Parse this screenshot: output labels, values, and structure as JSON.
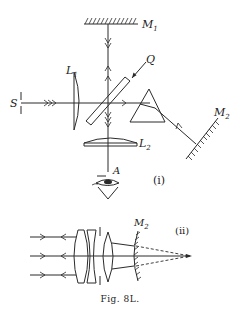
{
  "figure": {
    "caption": "Fig. 8L.",
    "part_i": {
      "label": "(i)",
      "components": {
        "mirror_1": "M",
        "mirror_1_sub": "1",
        "lens_1": "L",
        "lens_1_sub": "1",
        "lens_2": "L",
        "lens_2_sub": "2",
        "source_slit": "S",
        "plate": "Q",
        "mirror_2": "M",
        "mirror_2_sub": "2",
        "observer": "A"
      }
    },
    "part_ii": {
      "label": "(ii)",
      "components": {
        "mirror_2": "M",
        "mirror_2_sub": "2"
      }
    }
  }
}
